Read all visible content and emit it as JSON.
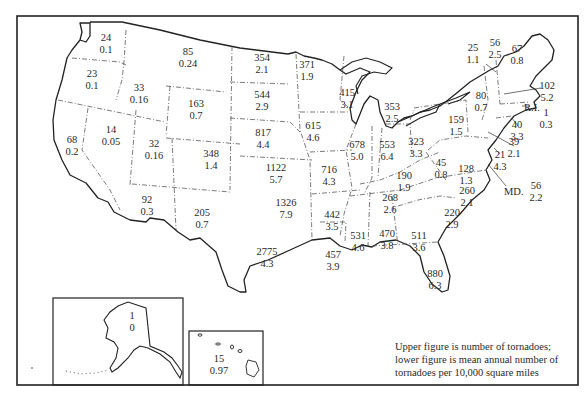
{
  "map": {
    "legend": {
      "line1": "Upper figure is number of tornadoes;",
      "line2": "lower figure is mean annual number of",
      "line3": "tornadoes per 10,000 square miles"
    },
    "insets": [
      "Alaska",
      "Hawaii"
    ],
    "abbreviations": {
      "ri": "R.I.",
      "md": "MD."
    },
    "states": [
      {
        "name": "Washington",
        "count": "24",
        "rate": "0.1",
        "x": 106,
        "y": 38
      },
      {
        "name": "Oregon",
        "count": "23",
        "rate": "0.1",
        "x": 92,
        "y": 74
      },
      {
        "name": "California",
        "count": "68",
        "rate": "0.2",
        "x": 72,
        "y": 140
      },
      {
        "name": "Idaho",
        "count": "33",
        "rate": "0.16",
        "x": 139,
        "y": 88
      },
      {
        "name": "Nevada",
        "count": "14",
        "rate": "0.05",
        "x": 111,
        "y": 130
      },
      {
        "name": "Montana",
        "count": "85",
        "rate": "0.24",
        "x": 188,
        "y": 52
      },
      {
        "name": "Wyoming",
        "count": "163",
        "rate": "0.7",
        "x": 196,
        "y": 104
      },
      {
        "name": "Utah",
        "count": "32",
        "rate": "0.16",
        "x": 154,
        "y": 144
      },
      {
        "name": "Arizona",
        "count": "92",
        "rate": "0.3",
        "x": 147,
        "y": 200
      },
      {
        "name": "Colorado",
        "count": "348",
        "rate": "1.4",
        "x": 211,
        "y": 154
      },
      {
        "name": "New Mexico",
        "count": "205",
        "rate": "0.7",
        "x": 202,
        "y": 213
      },
      {
        "name": "North Dakota",
        "count": "354",
        "rate": "2.1",
        "x": 262,
        "y": 58
      },
      {
        "name": "South Dakota",
        "count": "544",
        "rate": "2.9",
        "x": 262,
        "y": 95
      },
      {
        "name": "Nebraska",
        "count": "817",
        "rate": "4.4",
        "x": 263,
        "y": 133
      },
      {
        "name": "Kansas",
        "count": "1122",
        "rate": "5.7",
        "x": 276,
        "y": 168
      },
      {
        "name": "Oklahoma",
        "count": "1326",
        "rate": "7.9",
        "x": 286,
        "y": 203
      },
      {
        "name": "Texas",
        "count": "2775",
        "rate": "4.3",
        "x": 267,
        "y": 252
      },
      {
        "name": "Minnesota",
        "count": "371",
        "rate": "1.9",
        "x": 307,
        "y": 65
      },
      {
        "name": "Iowa",
        "count": "615",
        "rate": "4.6",
        "x": 313,
        "y": 126
      },
      {
        "name": "Missouri",
        "count": "716",
        "rate": "4.3",
        "x": 329,
        "y": 170
      },
      {
        "name": "Arkansas",
        "count": "442",
        "rate": "3.5",
        "x": 332,
        "y": 215
      },
      {
        "name": "Louisiana",
        "count": "457",
        "rate": "3.9",
        "x": 333,
        "y": 255
      },
      {
        "name": "Wisconsin",
        "count": "415",
        "rate": "3.1",
        "x": 347,
        "y": 93
      },
      {
        "name": "Illinois",
        "count": "678",
        "rate": "5.0",
        "x": 357,
        "y": 145
      },
      {
        "name": "Michigan",
        "count": "353",
        "rate": "2.5",
        "x": 392,
        "y": 107
      },
      {
        "name": "Indiana",
        "count": "553",
        "rate": "6.4",
        "x": 387,
        "y": 145
      },
      {
        "name": "Ohio",
        "count": "323",
        "rate": "3.3",
        "x": 416,
        "y": 142
      },
      {
        "name": "Kentucky",
        "count": "190",
        "rate": "1.9",
        "x": 404,
        "y": 176
      },
      {
        "name": "Tennessee",
        "count": "268",
        "rate": "2.6",
        "x": 390,
        "y": 198
      },
      {
        "name": "Mississippi",
        "count": "531",
        "rate": "4.6",
        "x": 358,
        "y": 236
      },
      {
        "name": "Alabama",
        "count": "470",
        "rate": "3.8",
        "x": 387,
        "y": 234
      },
      {
        "name": "Georgia",
        "count": "511",
        "rate": "3.6",
        "x": 419,
        "y": 236
      },
      {
        "name": "Florida",
        "count": "880",
        "rate": "6.3",
        "x": 435,
        "y": 274
      },
      {
        "name": "South Carolina",
        "count": "220",
        "rate": "2.9",
        "x": 452,
        "y": 213
      },
      {
        "name": "North Carolina",
        "count": "260",
        "rate": "2.1",
        "x": 467,
        "y": 191
      },
      {
        "name": "Virginia",
        "count": "128",
        "rate": "1.3",
        "x": 466,
        "y": 169
      },
      {
        "name": "West Virginia",
        "count": "45",
        "rate": "0.8",
        "x": 441,
        "y": 163
      },
      {
        "name": "Pennsylvania",
        "count": "159",
        "rate": "1.5",
        "x": 456,
        "y": 120
      },
      {
        "name": "New York",
        "count": "80",
        "rate": "0.7",
        "x": 481,
        "y": 96
      },
      {
        "name": "Vermont",
        "count": "25",
        "rate": "1.1",
        "x": 473,
        "y": 48
      },
      {
        "name": "New Hampshire",
        "count": "56",
        "rate": "2.5",
        "x": 495,
        "y": 43
      },
      {
        "name": "Maine",
        "count": "67",
        "rate": "0.8",
        "x": 517,
        "y": 49
      },
      {
        "name": "Massachusetts",
        "count": "102",
        "rate": "5.2",
        "x": 547,
        "y": 86
      },
      {
        "name": "Rhode Island",
        "count": "1",
        "rate": "0.3",
        "x": 546,
        "y": 113
      },
      {
        "name": "Connecticut",
        "count": "40",
        "rate": "3.3",
        "x": 517,
        "y": 125
      },
      {
        "name": "New Jersey",
        "count": "39",
        "rate": "2.1",
        "x": 514,
        "y": 142
      },
      {
        "name": "Delaware",
        "count": "21",
        "rate": "4.3",
        "x": 500,
        "y": 155
      },
      {
        "name": "Maryland",
        "count": "56",
        "rate": "2.2",
        "x": 536,
        "y": 186
      },
      {
        "name": "Alaska",
        "count": "1",
        "rate": "0",
        "x": 132,
        "y": 316
      },
      {
        "name": "Hawaii",
        "count": "15",
        "rate": "0.97",
        "x": 219,
        "y": 359
      }
    ]
  }
}
